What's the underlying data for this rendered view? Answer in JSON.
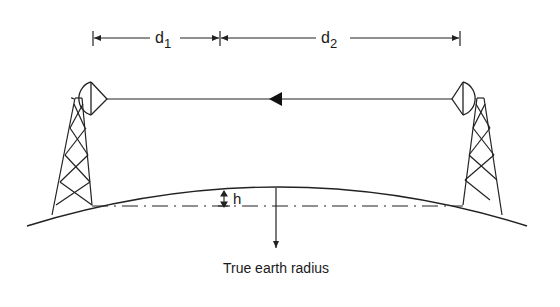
{
  "diagram": {
    "labels": {
      "d1": "d",
      "d1_sub": "1",
      "d2": "d",
      "d2_sub": "2",
      "h": "h",
      "caption": "True earth radius"
    },
    "elements": [
      {
        "id": "left-tower",
        "type": "lattice-tower"
      },
      {
        "id": "right-tower",
        "type": "lattice-tower"
      },
      {
        "id": "left-antenna",
        "type": "dish-antenna"
      },
      {
        "id": "right-antenna",
        "type": "dish-antenna"
      },
      {
        "id": "signal-path",
        "type": "line",
        "direction": "right-to-left"
      },
      {
        "id": "earth-surface",
        "type": "arc"
      },
      {
        "id": "reference-line",
        "type": "dash-dot-line"
      },
      {
        "id": "radius-arrow",
        "type": "arrow",
        "direction": "down"
      }
    ],
    "colors": {
      "stroke": "#222222",
      "background": "#ffffff"
    }
  }
}
